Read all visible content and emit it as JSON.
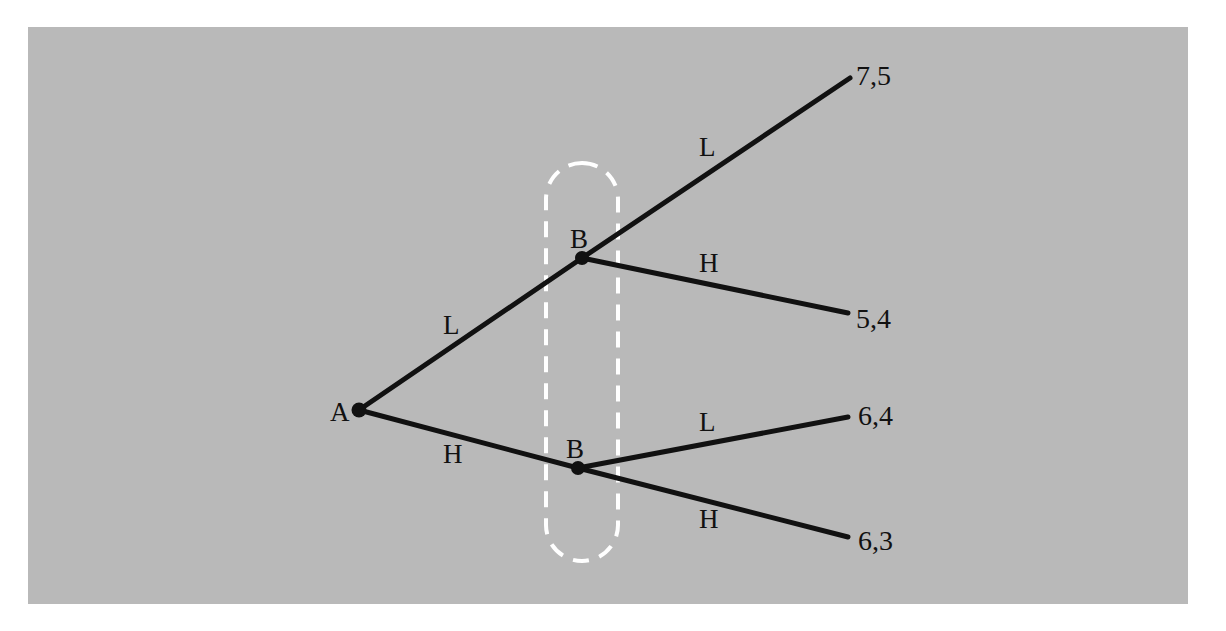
{
  "figure": {
    "type": "extensive-form-game-tree",
    "background_color": "#ffffff",
    "plate_color": "#b9b9b9",
    "line_color": "#111111",
    "information_set_color": "#ffffff"
  },
  "nodes": {
    "root": {
      "label": "A",
      "x": 359,
      "y": 410,
      "label_x": 330,
      "label_y": 399
    },
    "upper": {
      "label": "B",
      "x": 582,
      "y": 258,
      "label_x": 570,
      "label_y": 226
    },
    "lower": {
      "label": "B",
      "x": 578,
      "y": 468,
      "label_x": 566,
      "label_y": 436
    }
  },
  "edges": [
    {
      "name": "root-to-upper",
      "label": "L",
      "label_x": 443,
      "label_y": 312,
      "x1": 359,
      "y1": 410,
      "x2": 582,
      "y2": 258
    },
    {
      "name": "root-to-lower",
      "label": "H",
      "label_x": 443,
      "label_y": 441,
      "x1": 359,
      "y1": 410,
      "x2": 578,
      "y2": 468
    },
    {
      "name": "upper-L",
      "label": "L",
      "label_x": 699,
      "label_y": 134,
      "x1": 582,
      "y1": 258,
      "x2": 850,
      "y2": 78
    },
    {
      "name": "upper-H",
      "label": "H",
      "label_x": 699,
      "label_y": 250,
      "x1": 582,
      "y1": 258,
      "x2": 848,
      "y2": 313
    },
    {
      "name": "lower-L",
      "label": "L",
      "label_x": 699,
      "label_y": 409,
      "x1": 578,
      "y1": 468,
      "x2": 848,
      "y2": 417
    },
    {
      "name": "lower-H",
      "label": "H",
      "label_x": 699,
      "label_y": 506,
      "x1": 578,
      "y1": 468,
      "x2": 848,
      "y2": 537
    }
  ],
  "payoffs": [
    {
      "name": "payoff-LL",
      "text": "7,5",
      "x": 856,
      "y": 62,
      "player_a": 7,
      "player_b": 5,
      "path": [
        "L",
        "L"
      ]
    },
    {
      "name": "payoff-LH",
      "text": "5,4",
      "x": 856,
      "y": 305,
      "player_a": 5,
      "player_b": 4,
      "path": [
        "L",
        "H"
      ]
    },
    {
      "name": "payoff-HL",
      "text": "6,4",
      "x": 858,
      "y": 402,
      "player_a": 6,
      "player_b": 4,
      "path": [
        "H",
        "L"
      ]
    },
    {
      "name": "payoff-HH",
      "text": "6,3",
      "x": 858,
      "y": 527,
      "player_a": 6,
      "player_b": 3,
      "path": [
        "H",
        "H"
      ]
    }
  ],
  "information_set": {
    "name": "player-b-information-set",
    "x": 546,
    "y": 163,
    "width": 72,
    "height": 398,
    "dash_pattern": "16 11",
    "stroke_width": 4
  },
  "chart_data": {
    "type": "tree",
    "title": "",
    "players": [
      "A",
      "B"
    ],
    "actions": [
      "L",
      "H"
    ],
    "outcomes": [
      {
        "path": "L,L",
        "payoff": "7,5"
      },
      {
        "path": "L,H",
        "payoff": "5,4"
      },
      {
        "path": "H,L",
        "payoff": "6,4"
      },
      {
        "path": "H,H",
        "payoff": "6,3"
      }
    ]
  }
}
